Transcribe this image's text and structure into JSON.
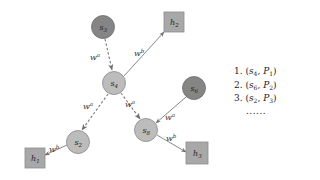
{
  "diagram": {
    "colors": {
      "dark_node": "#888888",
      "dark_node_stroke": "#707070",
      "light_node": "#bdbdbd",
      "light_node_stroke": "#8a8a8a",
      "square_node": "#a9a9a9",
      "square_stroke": "#8c8c8c",
      "edge": "#777777"
    },
    "nodes": [
      {
        "id": "s3",
        "base": "s",
        "sub": "3",
        "shape": "circle",
        "shade": "dark"
      },
      {
        "id": "s4",
        "base": "s",
        "sub": "4",
        "shape": "circle",
        "shade": "light"
      },
      {
        "id": "s6",
        "base": "s",
        "sub": "6",
        "shape": "circle",
        "shade": "dark"
      },
      {
        "id": "s2",
        "base": "s",
        "sub": "2",
        "shape": "circle",
        "shade": "light"
      },
      {
        "id": "s8",
        "base": "s",
        "sub": "8",
        "shape": "circle",
        "shade": "light"
      },
      {
        "id": "h1",
        "base": "h",
        "sub": "1",
        "shape": "square"
      },
      {
        "id": "h2",
        "base": "h",
        "sub": "2",
        "shape": "square"
      },
      {
        "id": "h3",
        "base": "h",
        "sub": "3",
        "shape": "square"
      }
    ],
    "edges": [
      {
        "from": "s3",
        "to": "s4",
        "style": "dashed",
        "label_base": "w",
        "label_sup": "a"
      },
      {
        "from": "s4",
        "to": "h2",
        "style": "solid",
        "label_base": "w",
        "label_sup": "b"
      },
      {
        "from": "s4",
        "to": "s2",
        "style": "dashed",
        "label_base": "w",
        "label_sup": "a"
      },
      {
        "from": "s4",
        "to": "s8",
        "style": "dashed",
        "label_base": "w",
        "label_sup": "a"
      },
      {
        "from": "s6",
        "to": "s8",
        "style": "solid",
        "label_base": "w",
        "label_sup": "a"
      },
      {
        "from": "s2",
        "to": "h1",
        "style": "solid",
        "label_base": "w",
        "label_sup": "b"
      },
      {
        "from": "s8",
        "to": "h3",
        "style": "solid",
        "label_base": "w",
        "label_sup": "b"
      }
    ]
  },
  "legend": {
    "items": [
      {
        "num": "1.",
        "node": "s",
        "node_sub": "4",
        "path": "P",
        "path_sub": "1"
      },
      {
        "num": "2.",
        "node": "s",
        "node_sub": "6",
        "path": "P",
        "path_sub": "2"
      },
      {
        "num": "3.",
        "node": "s",
        "node_sub": "2",
        "path": "P",
        "path_sub": "3"
      }
    ],
    "ellipsis": "......"
  }
}
